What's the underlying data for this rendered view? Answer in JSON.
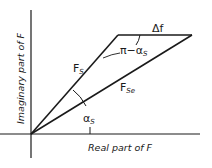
{
  "diagram": {
    "axes": {
      "x_label": "Real part of F",
      "y_label": "Imaginary part of F"
    },
    "vectors": [
      {
        "name": "F",
        "subscript": "S",
        "description": "vector F_S from origin"
      },
      {
        "name": "F",
        "subscript": "Se",
        "description": "vector F_Se from origin"
      },
      {
        "name": "Δf",
        "subscript": "",
        "description": "horizontal difference vector"
      }
    ],
    "angles": [
      {
        "label": "α",
        "subscript": "S",
        "description": "angle between F_S and F_Se"
      },
      {
        "label": "π−α",
        "subscript": "S",
        "description": "angle between Δf and F_Se"
      }
    ],
    "colors": {
      "line": "#1a1a1a",
      "background": "#ffffff"
    }
  }
}
